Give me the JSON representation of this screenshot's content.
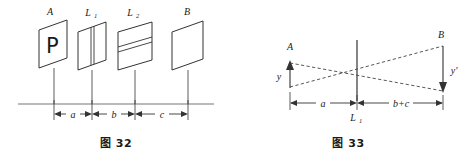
{
  "figures": [
    {
      "id": "fig32",
      "caption_prefix": "图",
      "caption_number": "32",
      "caption_full": "图 32",
      "type": "optical-bench-layout",
      "description": "Optical bench with object plate A showing letter P, two slit screens L1 and L2, and screen B, mounted on a rail with labelled separations a, b and c.",
      "elements": [
        {
          "name": "plate-A",
          "label": "A",
          "content_glyph": "P",
          "kind": "object-plate"
        },
        {
          "name": "plate-L1",
          "label": "L",
          "sublabel": "1",
          "kind": "vertical-slit",
          "slit_orientation": "vertical"
        },
        {
          "name": "plate-L2",
          "label": "L",
          "sublabel": "2",
          "kind": "horizontal-slit",
          "slit_orientation": "horizontal"
        },
        {
          "name": "plate-B",
          "label": "B",
          "kind": "screen"
        }
      ],
      "dimensions": [
        {
          "name": "dim-a",
          "label": "a",
          "from": "plate-A",
          "to": "plate-L1"
        },
        {
          "name": "dim-b",
          "label": "b",
          "from": "plate-L1",
          "to": "plate-L2"
        },
        {
          "name": "dim-c",
          "label": "c",
          "from": "plate-L2",
          "to": "plate-B"
        }
      ]
    },
    {
      "id": "fig33",
      "caption_prefix": "图",
      "caption_number": "33",
      "caption_full": "图 33",
      "type": "ray-diagram",
      "description": "Thin lens ray diagram: object arrow A of height y on the left of lens L1, inverted image arrow B of height y-prime on the right, dashed rays crossing at the lens.",
      "elements": [
        {
          "name": "object-arrow-A",
          "label": "A",
          "height_label": "y",
          "direction": "up"
        },
        {
          "name": "image-arrow-B",
          "label": "B",
          "height_label": "y'",
          "direction": "down"
        },
        {
          "name": "lens-axis-L1",
          "label": "L",
          "sublabel": "1"
        }
      ],
      "dimensions": [
        {
          "name": "dim-a",
          "label": "a",
          "from": "object-arrow-A",
          "to": "lens-axis-L1"
        },
        {
          "name": "dim-bc",
          "label": "b+c",
          "from": "lens-axis-L1",
          "to": "image-arrow-B"
        }
      ]
    }
  ],
  "style": {
    "ink": "#1a1a1a",
    "rail": "#666666",
    "background": "#ffffff"
  }
}
